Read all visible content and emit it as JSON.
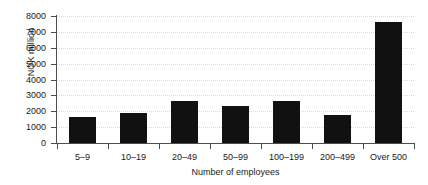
{
  "chart_data": {
    "type": "bar",
    "title": "",
    "subtitle": "",
    "xlabel": "Number of employees",
    "ylabel": "NOK million",
    "categories": [
      "5–9",
      "10–19",
      "20–49",
      "50–99",
      "100–199",
      "200–499",
      "Over 500"
    ],
    "values": [
      1630,
      1900,
      2650,
      2350,
      2650,
      1760,
      7600
    ],
    "series": [
      {
        "name": "NOK million",
        "values": [
          1630,
          1900,
          2650,
          2350,
          2650,
          1760,
          7600
        ]
      }
    ],
    "ylim": [
      0,
      8000
    ],
    "yticks": [
      0,
      1000,
      2000,
      3000,
      4000,
      5000,
      6000,
      7000,
      8000
    ],
    "ytick_labels": [
      "0",
      "1000",
      "2000",
      "3000",
      "4000",
      "5000",
      "6000",
      "7000",
      "8000"
    ],
    "grid": "horizontal-dotted",
    "legend": "none",
    "bar_color": "#111111",
    "grid_color": "#d9d9d9",
    "axis_color": "#4d4d4d",
    "background_color": "#ffffff"
  }
}
